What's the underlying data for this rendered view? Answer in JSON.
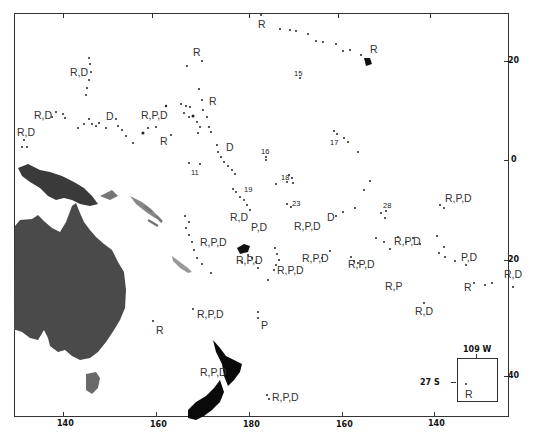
{
  "map": {
    "title": "",
    "x_axis": {
      "labels": [
        {
          "text": "140",
          "x": 63
        },
        {
          "text": "160",
          "x": 156
        },
        {
          "text": "180",
          "x": 249
        },
        {
          "text": "160",
          "x": 342
        },
        {
          "text": "140",
          "x": 434
        }
      ],
      "top_ticks": [
        63,
        152,
        249,
        338,
        430
      ]
    },
    "y_axis": {
      "labels": [
        {
          "text": "20",
          "y": 61
        },
        {
          "text": "0",
          "y": 160
        },
        {
          "text": "20",
          "y": 260
        },
        {
          "text": "40",
          "y": 376
        }
      ]
    },
    "inset": {
      "lon_label": "109 W",
      "lat_label": "27 S",
      "site_label": "R"
    },
    "site_labels": [
      {
        "text": "R",
        "x": 258,
        "y": 19
      },
      {
        "text": "R",
        "x": 370,
        "y": 44
      },
      {
        "text": "R",
        "x": 193,
        "y": 47
      },
      {
        "text": "R,D",
        "x": 70,
        "y": 67
      },
      {
        "text": "R",
        "x": 209,
        "y": 96
      },
      {
        "text": "R,D",
        "x": 34,
        "y": 110
      },
      {
        "text": "D",
        "x": 106,
        "y": 111
      },
      {
        "text": "R,P,D",
        "x": 141,
        "y": 110
      },
      {
        "text": "R,D",
        "x": 17,
        "y": 127
      },
      {
        "text": "R",
        "x": 160,
        "y": 136
      },
      {
        "text": "D",
        "x": 226,
        "y": 142
      },
      {
        "text": "R,P,D",
        "x": 445,
        "y": 193
      },
      {
        "text": "R,D",
        "x": 230,
        "y": 212
      },
      {
        "text": "P,D",
        "x": 251,
        "y": 222
      },
      {
        "text": "R,P,D",
        "x": 294,
        "y": 221
      },
      {
        "text": "D",
        "x": 327,
        "y": 212
      },
      {
        "text": "R,P,D",
        "x": 200,
        "y": 237
      },
      {
        "text": "R,P,D",
        "x": 236,
        "y": 255
      },
      {
        "text": "R,P,D",
        "x": 394,
        "y": 236
      },
      {
        "text": "R,P,D",
        "x": 302,
        "y": 253
      },
      {
        "text": "R,P,D",
        "x": 277,
        "y": 265
      },
      {
        "text": "R,P,D",
        "x": 348,
        "y": 259
      },
      {
        "text": "P,D",
        "x": 461,
        "y": 252
      },
      {
        "text": "R,D",
        "x": 504,
        "y": 269
      },
      {
        "text": "R",
        "x": 464,
        "y": 282
      },
      {
        "text": "R,P",
        "x": 385,
        "y": 281
      },
      {
        "text": "R,D",
        "x": 415,
        "y": 306
      },
      {
        "text": "R,P,D",
        "x": 197,
        "y": 309
      },
      {
        "text": "R",
        "x": 156,
        "y": 325
      },
      {
        "text": "P",
        "x": 261,
        "y": 320
      },
      {
        "text": "R,P,D",
        "x": 200,
        "y": 367
      },
      {
        "text": "R,P,D",
        "x": 272,
        "y": 392
      }
    ],
    "number_labels": [
      {
        "text": "15",
        "x": 294,
        "y": 70
      },
      {
        "text": "16",
        "x": 261,
        "y": 148
      },
      {
        "text": "17",
        "x": 330,
        "y": 139
      },
      {
        "text": "11",
        "x": 191,
        "y": 169
      },
      {
        "text": "18",
        "x": 281,
        "y": 174
      },
      {
        "text": "19",
        "x": 244,
        "y": 186
      },
      {
        "text": "23",
        "x": 292,
        "y": 200
      },
      {
        "text": "28",
        "x": 383,
        "y": 202
      }
    ]
  }
}
